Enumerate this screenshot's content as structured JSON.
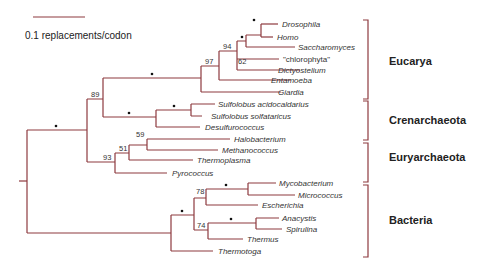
{
  "scale_bar": {
    "label": "0.1 replacements/codon",
    "value": 0.1
  },
  "colors": {
    "branch": "#8e3a3f",
    "text": "#333333"
  },
  "taxa": [
    "Drosophila",
    "Homo",
    "Saccharomyces",
    "\"chlorophyta\"",
    "Dictyostelium",
    "Entamoeba",
    "Giardia",
    "Sulfolobus acidocaldarius",
    "Sulfolobus solfataricus",
    "Desulfurococcus",
    "Halobacterium",
    "Methanococcus",
    "Thermoplasma",
    "Pyrococcus",
    "Mycobacterium",
    "Micrococcus",
    "Escherichia",
    "Anacystis",
    "Spirulina",
    "Thermus",
    "Thermotoga"
  ],
  "groups": [
    "Eucarya",
    "Crenarchaeota",
    "Euryarchaeota",
    "Bacteria"
  ],
  "bootstrap": {
    "n89": "89",
    "n97": "97",
    "n94": "94",
    "n62": "62",
    "n59": "59",
    "n51": "51",
    "n93": "93",
    "n78": "78",
    "n74": "74"
  },
  "strong_support_marker": "•"
}
